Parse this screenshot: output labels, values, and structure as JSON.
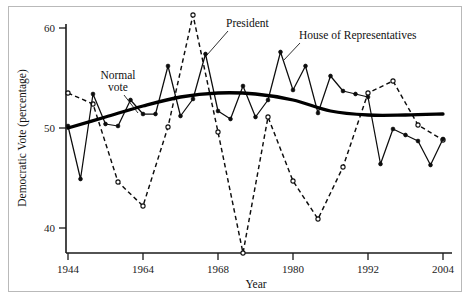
{
  "figure": {
    "name": "democratic-vote-by-year",
    "frame": true
  },
  "chart_data": {
    "type": "line",
    "title": "",
    "xlabel": "Year",
    "ylabel": "Democratic Vote (percentage)",
    "xlim": [
      1944,
      2004
    ],
    "ylim": [
      36,
      62
    ],
    "yticks": [
      40,
      50,
      60
    ],
    "ytick_labels": [
      "40",
      "50",
      "60"
    ],
    "xticks": [
      1944,
      1964,
      1968,
      1980,
      1992,
      2004
    ],
    "xtick_labels": [
      "1944",
      "1964",
      "1968",
      "1980",
      "1992",
      "2004"
    ],
    "grid": false,
    "legend_position": "inline-annotations",
    "note": "X axis is an election-index axis: biennial elections drawn at even spacing; labelled ticks fall at index positions 0, 10, 12, 18, 24, 30.",
    "series": [
      {
        "name": "House of Representatives",
        "style": "solid-line-filled-circles",
        "marker": "filled-circle",
        "x": [
          1944,
          1946,
          1948,
          1950,
          1952,
          1954,
          1956,
          1958,
          1960,
          1962,
          1964,
          1966,
          1968,
          1970,
          1972,
          1974,
          1976,
          1978,
          1980,
          1982,
          1984,
          1986,
          1988,
          1990,
          1992,
          1994,
          1996,
          1998,
          2000,
          2002,
          2004
        ],
        "values": [
          50.2,
          44.9,
          53.4,
          50.4,
          50.2,
          52.8,
          51.4,
          51.4,
          56.2,
          51.2,
          52.9,
          57.4,
          51.7,
          50.9,
          54.2,
          51.1,
          52.8,
          57.6,
          53.8,
          56.2,
          51.5,
          55.2,
          53.7,
          53.4,
          53.1,
          46.4,
          49.9,
          49.3,
          48.7,
          46.3,
          48.9
        ]
      },
      {
        "name": "President",
        "style": "dashed-line-open-circles",
        "marker": "open-circle",
        "x": [
          1944,
          1948,
          1952,
          1956,
          1960,
          1964,
          1968,
          1972,
          1976,
          1980,
          1984,
          1988,
          1992,
          1996,
          2000,
          2004
        ],
        "values": [
          53.5,
          52.4,
          44.6,
          42.2,
          50.1,
          61.3,
          49.6,
          37.5,
          51.1,
          44.7,
          40.9,
          46.1,
          53.5,
          54.7,
          50.3,
          48.8
        ]
      },
      {
        "name": "Normal vote",
        "style": "thick-smooth-trend",
        "marker": "none",
        "x": [
          1944,
          1950,
          1956,
          1962,
          1968,
          1974,
          1980,
          1986,
          1992,
          1998,
          2004
        ],
        "values": [
          50.0,
          51.1,
          52.2,
          53.1,
          53.5,
          53.4,
          52.8,
          51.7,
          51.3,
          51.3,
          51.4
        ]
      }
    ],
    "annotations": [
      {
        "text": "Normal vote",
        "target_series": "Normal vote",
        "leader": true
      },
      {
        "text": "President",
        "target_series": "President",
        "leader": true
      },
      {
        "text": "House of Representatives",
        "target_series": "House of Representatives",
        "leader": true
      }
    ]
  }
}
